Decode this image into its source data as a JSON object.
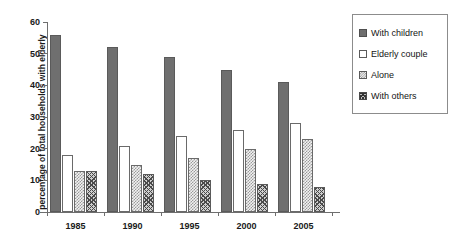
{
  "chart_data": {
    "type": "bar",
    "title": "",
    "xlabel": "",
    "ylabel": "percentage of total households with elderly",
    "categories": [
      "1985",
      "1990",
      "1995",
      "2000",
      "2005"
    ],
    "ylim": [
      0,
      60
    ],
    "yticks": [
      0,
      10,
      20,
      30,
      40,
      50,
      60
    ],
    "grid": false,
    "legend_position": "right",
    "series": [
      {
        "name": "With children",
        "values": [
          56,
          52,
          49,
          45,
          41
        ]
      },
      {
        "name": "Elderly couple",
        "values": [
          18,
          21,
          24,
          26,
          28
        ]
      },
      {
        "name": "Alone",
        "values": [
          13,
          15,
          17,
          20,
          23
        ]
      },
      {
        "name": "With others",
        "values": [
          13,
          12,
          10,
          9,
          8
        ]
      }
    ],
    "colors": {
      "with_children": "#6f6f6f",
      "elderly_couple": "#ffffff",
      "alone": "#f2f2f2",
      "with_others": "#cfcfcf",
      "axis": "#6e6e6e",
      "text": "#1a1a1a",
      "background": "#ffffff"
    }
  }
}
